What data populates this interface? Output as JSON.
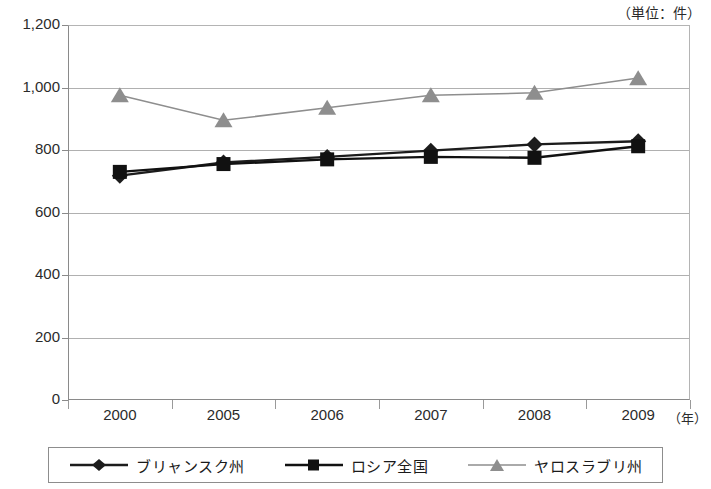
{
  "header": {
    "cut_title": "",
    "unit_label": "（単位：件）"
  },
  "axis": {
    "x_unit_label": "（年）",
    "y_ticks": [
      "0",
      "200",
      "400",
      "600",
      "800",
      "1,000",
      "1,200"
    ],
    "x_ticks": [
      "2000",
      "2005",
      "2006",
      "2007",
      "2008",
      "2009"
    ]
  },
  "legend": {
    "items": [
      {
        "label": "ブリャンスク州",
        "marker": "diamond-marker",
        "color": "#1c1c1c"
      },
      {
        "label": "ロシア全国",
        "marker": "square-marker",
        "color": "#111111"
      },
      {
        "label": "ヤロスラブリ州",
        "marker": "triangle-marker",
        "color": "#8e8e8e"
      }
    ]
  },
  "chart_data": {
    "type": "line",
    "title": "",
    "xlabel": "（年）",
    "ylabel": "（単位：件）",
    "categories": [
      "2000",
      "2005",
      "2006",
      "2007",
      "2008",
      "2009"
    ],
    "ylim": [
      0,
      1200
    ],
    "ytick_step": 200,
    "grid": true,
    "legend_position": "bottom",
    "series": [
      {
        "name": "ブリャンスク州",
        "marker": "diamond",
        "color": "#1c1c1c",
        "values": [
          718,
          760,
          778,
          798,
          818,
          828
        ]
      },
      {
        "name": "ロシア全国",
        "marker": "square",
        "color": "#111111",
        "values": [
          730,
          755,
          770,
          778,
          775,
          812
        ]
      },
      {
        "name": "ヤロスラブリ州",
        "marker": "triangle",
        "color": "#8e8e8e",
        "values": [
          975,
          895,
          935,
          975,
          983,
          1030
        ]
      }
    ]
  }
}
